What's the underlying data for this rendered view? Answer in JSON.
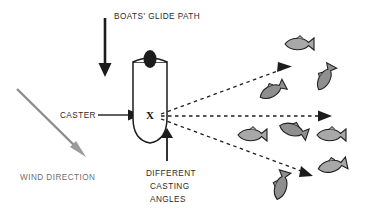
{
  "diagram": {
    "title_hidden": "",
    "background_color": "#ffffff",
    "ink_color": "#1c1c1c",
    "gray_color": "#8c8c8c",
    "fish_fill_color": "#a8a8a8",
    "labels": {
      "glide_path": "BOATS' GLIDE PATH",
      "caster": "CASTER",
      "wind_direction": "WIND DIRECTION",
      "casting_angles_line1": "DIFFERENT",
      "casting_angles_line2": "CASTING",
      "casting_angles_line3": "ANGLES",
      "boat_marker": "X"
    },
    "arrows": {
      "glide_path": {
        "name": "boats-glide-path-arrow",
        "direction": "down",
        "color": "#1c1c1c",
        "from_x": 105,
        "from_y": 18,
        "to_x": 105,
        "to_y": 76
      },
      "wind_direction": {
        "name": "wind-direction-arrow",
        "direction": "down-right",
        "color": "#9a9a9a",
        "from_x": 17,
        "from_y": 89,
        "to_x": 86,
        "to_y": 157
      },
      "caster_pointer": {
        "name": "caster-pointer-arrow",
        "direction": "right",
        "color": "#1c1c1c",
        "from_x": 98,
        "from_y": 115,
        "to_x": 138,
        "to_y": 115
      },
      "casting_angles_pointer": {
        "name": "casting-angles-pointer-arrow",
        "direction": "up",
        "color": "#1c1c1c",
        "from_x": 167,
        "from_y": 161,
        "to_x": 167,
        "to_y": 130
      }
    },
    "cast_lines": [
      {
        "name": "cast-line-upper",
        "style": "dashed",
        "from_x": 159,
        "from_y": 116,
        "to_x": 289,
        "to_y": 68
      },
      {
        "name": "cast-line-middle",
        "style": "dashed",
        "from_x": 159,
        "from_y": 116,
        "to_x": 328,
        "to_y": 116
      },
      {
        "name": "cast-line-lower",
        "style": "dashed",
        "from_x": 159,
        "from_y": 119,
        "to_x": 313,
        "to_y": 175
      }
    ],
    "boat": {
      "name": "boat-hull",
      "center_x": 150,
      "center_y": 108,
      "angler_marker": "X"
    },
    "fish": [
      {
        "id": "fish-1",
        "x": 299,
        "y": 44,
        "angle": 0,
        "scale": 1.0
      },
      {
        "id": "fish-2",
        "x": 325,
        "y": 78,
        "angle": -62,
        "scale": 0.95
      },
      {
        "id": "fish-3",
        "x": 272,
        "y": 91,
        "angle": -28,
        "scale": 0.95
      },
      {
        "id": "fish-4",
        "x": 252,
        "y": 135,
        "angle": 0,
        "scale": 1.0
      },
      {
        "id": "fish-5",
        "x": 293,
        "y": 130,
        "angle": 18,
        "scale": 1.0
      },
      {
        "id": "fish-6",
        "x": 331,
        "y": 135,
        "angle": 0,
        "scale": 1.0
      },
      {
        "id": "fish-7",
        "x": 332,
        "y": 166,
        "angle": -12,
        "scale": 1.0
      },
      {
        "id": "fish-8",
        "x": 281,
        "y": 186,
        "angle": -74,
        "scale": 1.0
      }
    ]
  }
}
